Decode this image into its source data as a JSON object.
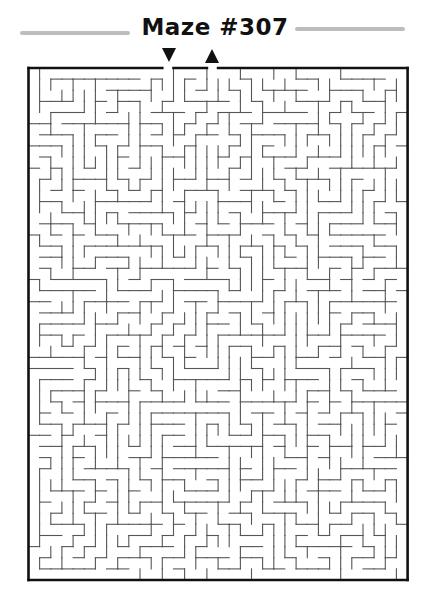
{
  "header": {
    "title": "Maze #307"
  },
  "markers": {
    "entrance": {
      "icon": "down-arrow-icon",
      "glyph": "▼"
    },
    "exit": {
      "icon": "up-arrow-icon",
      "glyph": "▲"
    }
  },
  "maze": {
    "cols": 34,
    "rows": 46,
    "origin": [
      28.5,
      68
    ],
    "cell_w": 11.15,
    "cell_h": 11.13,
    "entrance_col": 12,
    "exit_col": 16,
    "seed": 307,
    "border_color": "#111111",
    "wall_color": "#555555",
    "border_width": 2.6,
    "wall_width": 1.1
  },
  "colors": {
    "title_bar": "#bdbdbd",
    "title_text": "#111111",
    "background": "#ffffff"
  }
}
